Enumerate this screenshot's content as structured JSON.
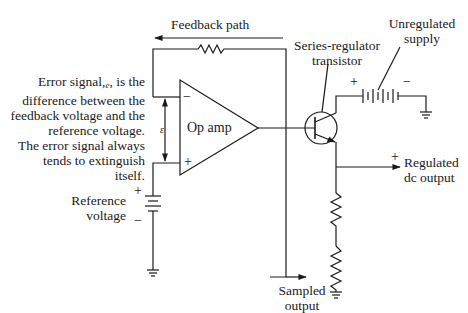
{
  "diagram": {
    "labels": {
      "feedback_path": "Feedback path",
      "series_transistor_l1": "Series-regulator",
      "series_transistor_l2": "transistor",
      "unregulated_l1": "Unregulated",
      "unregulated_l2": "supply",
      "error_l1": "Error signal,",
      "error_l1_sym": "e",
      "error_l1_tail": ", is the",
      "error_l2": "difference between the",
      "error_l3": "feedback voltage and the",
      "error_l4": "reference voltage.",
      "error_l5": "The error signal always",
      "error_l6": "tends to extinguish",
      "error_l7": "itself.",
      "op_amp": "Op amp",
      "epsilon": "ε",
      "reference_l1": "Reference",
      "reference_l2": "voltage",
      "regulated_l1": "Regulated",
      "regulated_l2": "dc output",
      "sampled_l1": "Sampled",
      "sampled_l2": "output"
    },
    "symbols": {
      "opamp_minus": "−",
      "opamp_plus": "+",
      "ref_plus": "+",
      "ref_minus": "−",
      "supply_plus": "+",
      "supply_minus": "−",
      "output_plus": "+"
    },
    "colors": {
      "line": "#1a1a1a",
      "background": "#ffffff"
    }
  }
}
